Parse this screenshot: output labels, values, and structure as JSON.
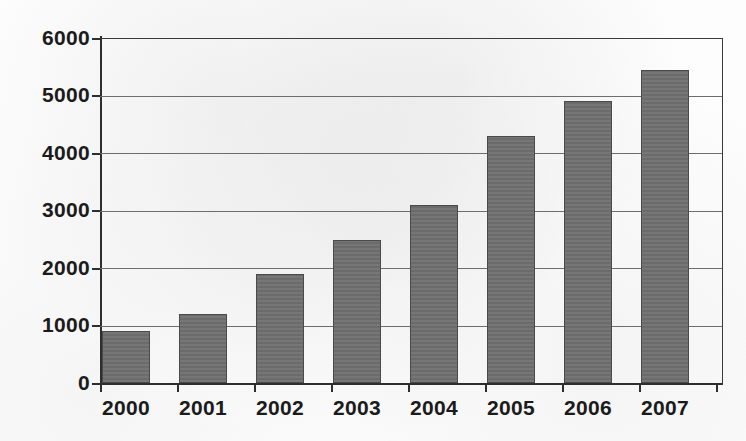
{
  "chart_data": {
    "type": "bar",
    "title": "",
    "subtitle": "",
    "xlabel": "",
    "ylabel": "",
    "categories": [
      "2000",
      "2001",
      "2002",
      "2003",
      "2004",
      "2005",
      "2006",
      "2007"
    ],
    "values": [
      900,
      1200,
      1900,
      2490,
      3100,
      4300,
      4900,
      5450
    ],
    "series": [
      {
        "name": "",
        "values": [
          900,
          1200,
          1900,
          2490,
          3100,
          4300,
          4900,
          5450
        ]
      }
    ],
    "ylim": [
      0,
      6000
    ],
    "yticks": [
      0,
      1000,
      2000,
      3000,
      4000,
      5000,
      6000
    ],
    "ytick_labels": [
      "0",
      "1000",
      "2000",
      "3000",
      "4000",
      "5000",
      "6000"
    ],
    "xtick_labels": [
      "2000",
      "2001",
      "2002",
      "2003",
      "2004",
      "2005",
      "2006",
      "2007"
    ],
    "grid": true,
    "grid_axis": "y",
    "legend": false,
    "legend_position": "none",
    "bar_color": "#6f6f6f",
    "bar_edge_color": "#4a4a4a",
    "axis_color": "#2e2e2e",
    "grid_color": "#6d6d6d",
    "background_color": "#fbfbfb",
    "text_color": "#1b1b1b"
  }
}
